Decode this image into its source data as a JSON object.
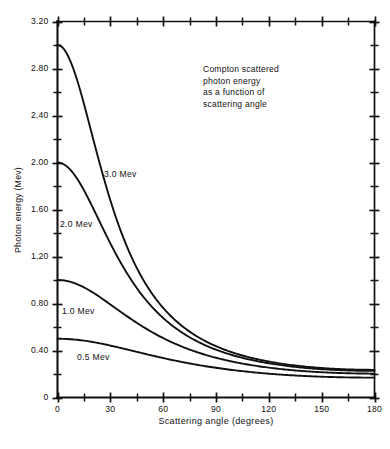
{
  "chart_data": {
    "type": "line",
    "title": "",
    "annotation": [
      "Compton scattered",
      "photon energy",
      "as a function of",
      "scattering angle"
    ],
    "xlabel": "Scattering angle (degrees)",
    "ylabel": "Photon energy (Mev)",
    "xlim": [
      0,
      180
    ],
    "ylim": [
      0,
      3.2
    ],
    "grid": false,
    "legend_position": "inline-curve-labels",
    "x_major_ticks": [
      0,
      30,
      60,
      90,
      120,
      150,
      180
    ],
    "x_tick_labels": [
      "0",
      "30",
      "60",
      "90",
      "120",
      "150",
      "180"
    ],
    "x_minor_tick_interval": 15,
    "y_major_ticks": [
      0,
      0.4,
      0.8,
      1.2,
      1.6,
      2.0,
      2.4,
      2.8,
      3.2
    ],
    "y_tick_labels": [
      "0",
      "0.40",
      "0.80",
      "1.20",
      "1.60",
      "2.00",
      "2.40",
      "2.80",
      "3.20"
    ],
    "y_minor_tick_interval": 0.2,
    "x": [
      0,
      10,
      20,
      30,
      40,
      50,
      60,
      70,
      80,
      90,
      100,
      110,
      120,
      130,
      140,
      150,
      160,
      170,
      180
    ],
    "series": [
      {
        "name": "3.0 Mev",
        "label": "3.0 Mev",
        "incident_energy": 3.0,
        "values": [
          3.0,
          2.683,
          2.055,
          1.472,
          1.055,
          0.778,
          0.596,
          0.474,
          0.391,
          0.332,
          0.289,
          0.258,
          0.235,
          0.218,
          0.206,
          0.197,
          0.192,
          0.189,
          0.188
        ]
      },
      {
        "name": "2.0 Mev",
        "label": "2.0 Mev",
        "incident_energy": 2.0,
        "values": [
          2.0,
          1.847,
          1.504,
          1.157,
          0.877,
          0.673,
          0.53,
          0.429,
          0.357,
          0.306,
          0.268,
          0.24,
          0.219,
          0.204,
          0.193,
          0.185,
          0.18,
          0.177,
          0.176
        ]
      },
      {
        "name": "1.0 Mev",
        "label": "1.0 Mev",
        "incident_energy": 1.0,
        "values": [
          1.0,
          0.975,
          0.906,
          0.806,
          0.699,
          0.598,
          0.508,
          0.434,
          0.374,
          0.327,
          0.291,
          0.264,
          0.243,
          0.228,
          0.217,
          0.209,
          0.204,
          0.201,
          0.2
        ]
      },
      {
        "name": "0.5 Mev",
        "label": "0.5 Mev",
        "incident_energy": 0.5,
        "values": [
          0.5,
          0.494,
          0.478,
          0.451,
          0.419,
          0.384,
          0.348,
          0.315,
          0.285,
          0.259,
          0.237,
          0.22,
          0.206,
          0.195,
          0.188,
          0.182,
          0.179,
          0.177,
          0.177
        ]
      }
    ]
  },
  "colors": {
    "ink": "#111111",
    "background": "#ffffff"
  },
  "caption": {
    "text": ""
  }
}
